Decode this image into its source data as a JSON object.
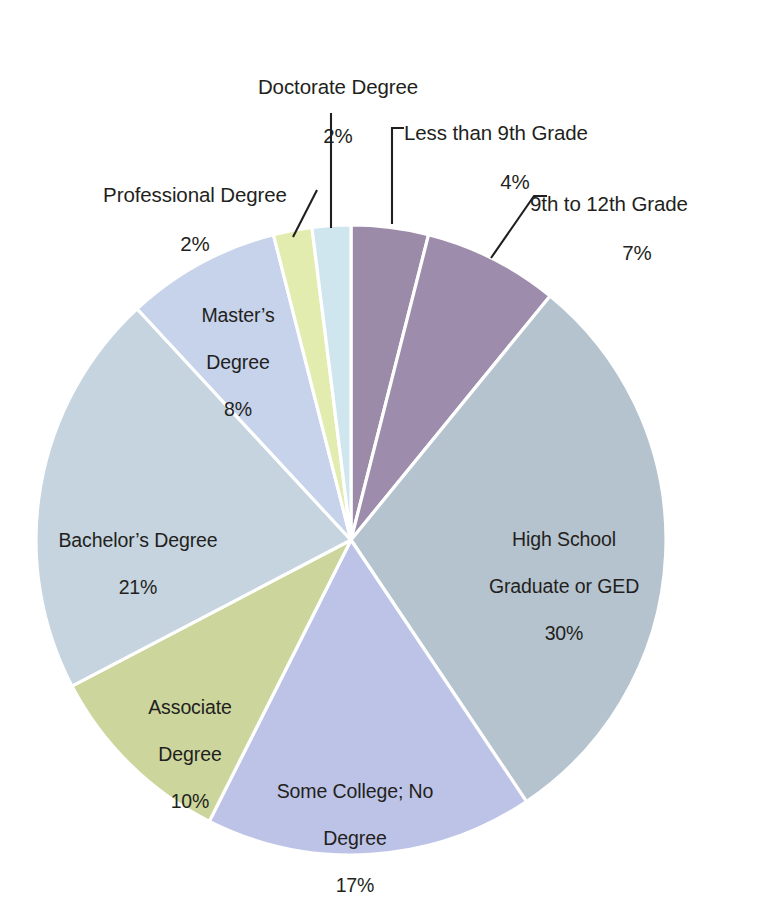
{
  "chart_data": {
    "type": "pie",
    "title": "",
    "subtitle": "",
    "xlabel": "",
    "ylabel": "",
    "legend_position": "none",
    "grid": false,
    "value_unit": "percent",
    "start_angle_deg": 0,
    "direction": "clockwise",
    "categories": [
      "Less than 9th Grade",
      "9th to 12th Grade",
      "High School Graduate or GED",
      "Some College; No Degree",
      "Associate Degree",
      "Bachelor's Degree",
      "Master's Degree",
      "Professional Degree",
      "Doctorate Degree"
    ],
    "values": [
      4,
      7,
      30,
      17,
      10,
      21,
      8,
      2,
      2
    ],
    "slices": [
      {
        "label": "Less than 9th Grade",
        "percent_text": "4%",
        "value": 4,
        "color": "#9b8aa8",
        "label_placement": "outside"
      },
      {
        "label": "9th to 12th Grade",
        "percent_text": "7%",
        "value": 7,
        "color": "#9d8cab",
        "label_placement": "outside"
      },
      {
        "label": "High School\nGraduate or GED",
        "label_line1": "High School",
        "label_line2": "Graduate or GED",
        "percent_text": "30%",
        "value": 30,
        "color": "#b5c3ce",
        "label_placement": "inside"
      },
      {
        "label": "Some College; No\nDegree",
        "label_line1": "Some College; No",
        "label_line2": "Degree",
        "percent_text": "17%",
        "value": 17,
        "color": "#bdc3e6",
        "label_placement": "inside"
      },
      {
        "label": "Associate\nDegree",
        "label_line1": "Associate",
        "label_line2": "Degree",
        "percent_text": "10%",
        "value": 10,
        "color": "#ccd69c",
        "label_placement": "inside"
      },
      {
        "label": "Bachelor's Degree",
        "percent_text": "21%",
        "value": 21,
        "color": "#c5d4df",
        "label_placement": "inside"
      },
      {
        "label": "Master's\nDegree",
        "label_line1": "Master’s",
        "label_line2": "Degree",
        "percent_text": "8%",
        "value": 8,
        "color": "#c6d3ea",
        "label_placement": "inside"
      },
      {
        "label": "Professional Degree",
        "percent_text": "2%",
        "value": 2,
        "color": "#e1ecae",
        "label_placement": "outside"
      },
      {
        "label": "Doctorate Degree",
        "percent_text": "2%",
        "value": 2,
        "color": "#cfe6ee",
        "label_placement": "outside"
      }
    ]
  },
  "labels": {
    "doctorate": {
      "name": "Doctorate Degree",
      "percent": "2%"
    },
    "professional": {
      "name": "Professional Degree",
      "percent": "2%"
    },
    "less_than_9th": {
      "name": "Less than 9th Grade",
      "percent": "4%"
    },
    "grade_9_to_12": {
      "name": "9th to 12th Grade",
      "percent": "7%"
    },
    "high_school": {
      "line1": "High School",
      "line2": "Graduate or GED",
      "percent": "30%"
    },
    "some_college": {
      "line1": "Some College; No",
      "line2": "Degree",
      "percent": "17%"
    },
    "associate": {
      "line1": "Associate",
      "line2": "Degree",
      "percent": "10%"
    },
    "bachelors": {
      "name": "Bachelor’s Degree",
      "percent": "21%"
    },
    "masters": {
      "line1": "Master’s",
      "line2": "Degree",
      "percent": "8%"
    }
  },
  "style": {
    "background": "#ffffff",
    "text_color": "#231f20",
    "separator_color": "#ffffff",
    "leader_line_color": "#231f20"
  }
}
